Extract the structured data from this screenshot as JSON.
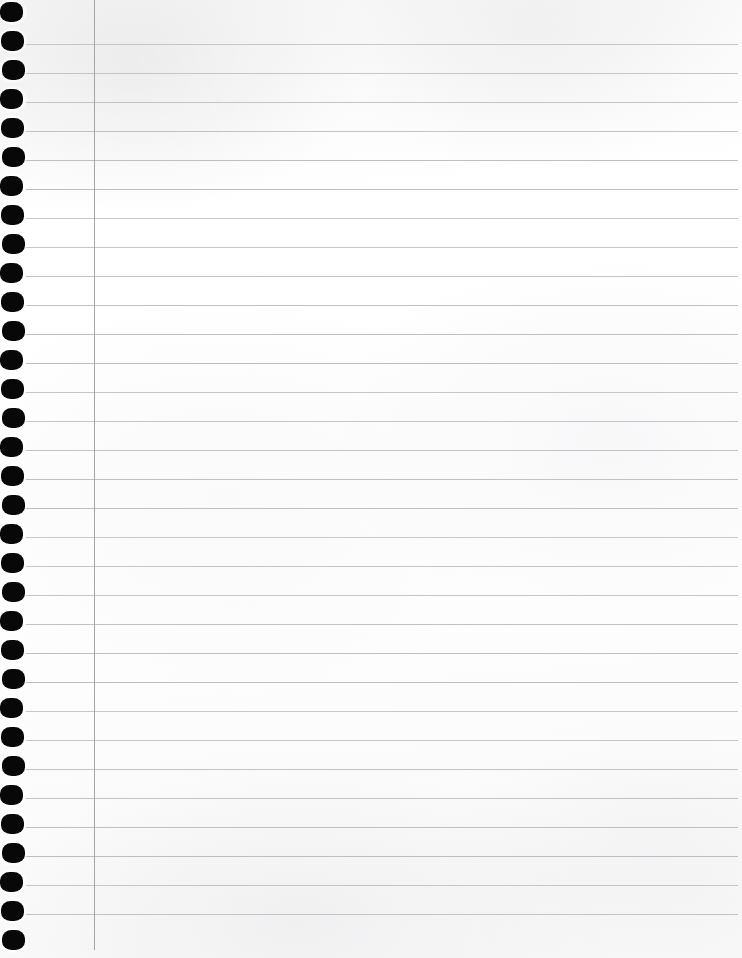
{
  "document": {
    "kind": "scanned-notebook-page",
    "title": "Blank lined notebook page",
    "page_width": 742,
    "page_height": 958,
    "text_content": "",
    "handwriting_present": "no",
    "printed_text_present": "no"
  },
  "paper": {
    "background_color": "#fdfdfd",
    "tint_color": "#f7f7f8",
    "texture": "scanned paper grain",
    "edge_note": "full-bleed scan, no visible page border"
  },
  "ruling": {
    "style": "college-ruled horizontal lines with single vertical margin",
    "line_color": "#b9babd",
    "line_thickness_px": 1,
    "line_spacing_px": 29,
    "first_line_y": 44,
    "line_count": 31,
    "line_start_x": 25,
    "line_end_x": 738,
    "line_y_positions": [
      44,
      73,
      102,
      131,
      160,
      189,
      218,
      247,
      276,
      305,
      334,
      363,
      392,
      421,
      450,
      479,
      508,
      537,
      566,
      595,
      624,
      653,
      682,
      711,
      740,
      769,
      798,
      827,
      856,
      885,
      914
    ]
  },
  "margin_rule": {
    "label": "vertical margin line",
    "color": "#9fa0a4",
    "thickness_px": 1,
    "x": 94,
    "y_start": 0,
    "y_end": 950
  },
  "punch_holes": {
    "label": "spiral binder punch holes",
    "color": "#080808",
    "count": 33,
    "width_px": 23,
    "height_px": 20,
    "left_x": 1,
    "first_center_y": 12,
    "spacing_px": 29,
    "shape": "rounded oval",
    "center_y_positions": [
      12,
      41,
      70,
      99,
      128,
      157,
      186,
      215,
      244,
      273,
      302,
      331,
      360,
      389,
      418,
      447,
      476,
      505,
      534,
      563,
      592,
      621,
      650,
      679,
      708,
      737,
      766,
      795,
      824,
      853,
      882,
      911,
      940
    ]
  }
}
